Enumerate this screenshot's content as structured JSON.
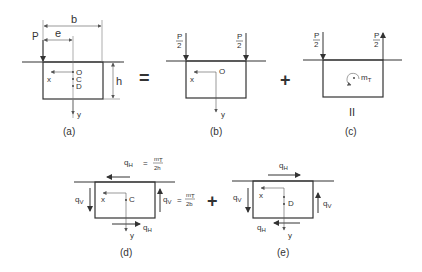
{
  "diagram": {
    "colors": {
      "line": "#333333",
      "thin": "#555555",
      "background": "#ffffff"
    },
    "operators": {
      "equals": "=",
      "plus1": "+",
      "plus2": "+",
      "equals_vertical": "II"
    },
    "panels": {
      "a": {
        "caption": "(a)",
        "load": "P",
        "dim_b": "b",
        "dim_e": "e",
        "dim_h": "h",
        "axis_x": "x",
        "axis_y": "y",
        "points": [
          "O",
          "C",
          "D"
        ]
      },
      "b": {
        "caption": "(b)",
        "load_left_num": "P",
        "load_left_den": "2",
        "load_right_num": "P",
        "load_right_den": "2",
        "axis_x": "x",
        "axis_y": "y",
        "origin": "O"
      },
      "c": {
        "caption": "(c)",
        "load_left_num": "P",
        "load_left_den": "2",
        "load_right_num": "P",
        "load_right_den": "2",
        "moment": "m",
        "moment_sub": "T"
      },
      "d": {
        "caption": "(d)",
        "qH_top": "q",
        "qH_top_sub": "H",
        "qH_top_eq": "=",
        "qH_top_num": "m",
        "qH_top_num_sub": "T",
        "qH_top_den": "2h",
        "qV_left": "q",
        "qV_left_sub": "V",
        "qV_right": "q",
        "qV_right_sub": "V",
        "qV_right_eq": "=",
        "qV_right_num": "m",
        "qV_right_num_sub": "T",
        "qV_right_den": "2b",
        "qH_bottom": "q",
        "qH_bottom_sub": "H",
        "axis_x": "x",
        "axis_y": "y",
        "point": "C"
      },
      "e": {
        "caption": "(e)",
        "qH_top": "q",
        "qH_top_sub": "H",
        "qV_left": "q",
        "qV_left_sub": "V",
        "qV_right": "q",
        "qV_right_sub": "V",
        "qH_bottom": "q",
        "qH_bottom_sub": "H",
        "axis_x": "x",
        "axis_y": "y",
        "point": "D"
      }
    }
  }
}
